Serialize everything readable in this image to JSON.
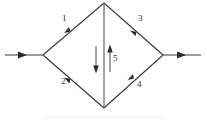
{
  "diagram": {
    "stroke_color": "#3a3a3a",
    "arrowhead_color": "#2b2b2b",
    "background_color": "#ffffff",
    "nodes": [
      {
        "name": "left-node",
        "x": 43,
        "y": 55
      },
      {
        "name": "top-node",
        "x": 104,
        "y": 3
      },
      {
        "name": "right-node",
        "x": 163,
        "y": 55
      },
      {
        "name": "bottom-node",
        "x": 104,
        "y": 108
      }
    ],
    "edges": [
      {
        "id": "1",
        "label": "1",
        "from": "left-node",
        "to": "top-node",
        "label_x": 62,
        "label_y": 14
      },
      {
        "id": "2",
        "label": "2",
        "from": "left-node",
        "to": "bottom-node",
        "label_x": 61,
        "label_y": 77
      },
      {
        "id": "3",
        "label": "3",
        "from": "top-node",
        "to": "right-node",
        "label_x": 138,
        "label_y": 14
      },
      {
        "id": "4",
        "label": "4",
        "from": "bottom-node",
        "to": "right-node",
        "label_x": 137,
        "label_y": 80
      },
      {
        "id": "5",
        "label": "5",
        "from": "top-node",
        "to": "bottom-node",
        "label_x": 113,
        "label_y": 54
      }
    ],
    "source_arrow": {
      "name": "input-arrow",
      "x1": 5,
      "y1": 55,
      "x2": 43,
      "y2": 55
    },
    "sink_arrow": {
      "name": "output-arrow",
      "x1": 163,
      "y1": 55,
      "x2": 201,
      "y2": 55
    },
    "center_arrows": [
      {
        "name": "flow-down-arrow",
        "x": 96,
        "y1": 46,
        "y2": 72,
        "direction": "down"
      },
      {
        "name": "flow-up-arrow",
        "x": 110,
        "y1": 72,
        "y2": 46,
        "direction": "up"
      }
    ]
  }
}
